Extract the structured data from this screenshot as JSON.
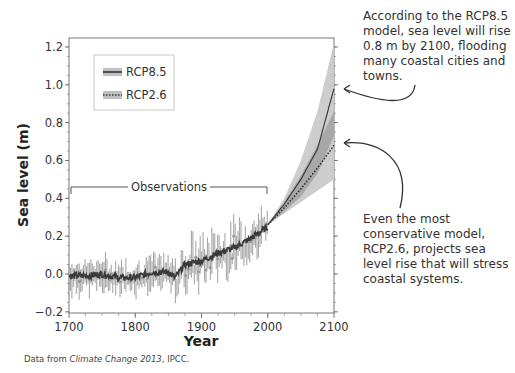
{
  "chart_data": {
    "type": "line",
    "title": "",
    "xlabel": "Year",
    "ylabel": "Sea level (m)",
    "xlim": [
      1700,
      2100
    ],
    "ylim": [
      -0.2,
      1.25
    ],
    "x_ticks": [
      "1700",
      "1800",
      "1900",
      "2000",
      "2100"
    ],
    "y_ticks": [
      "−0.2",
      "0.0",
      "0.2",
      "0.4",
      "0.6",
      "0.8",
      "1.0",
      "1.2"
    ],
    "grid": false,
    "legend_position": "upper-left",
    "legend": [
      {
        "name": "RCP8.5",
        "style": "solid dark line with gray band"
      },
      {
        "name": "RCP2.6",
        "style": "dotted dark line with gray band"
      }
    ],
    "annotations": [
      {
        "text": "Observations",
        "x_range": [
          1700,
          2000
        ]
      }
    ],
    "series": [
      {
        "name": "Observations",
        "x": [
          1700,
          1725,
          1750,
          1775,
          1800,
          1825,
          1850,
          1860,
          1875,
          1900,
          1925,
          1950,
          1975,
          2000
        ],
        "values": [
          -0.01,
          -0.01,
          0.0,
          -0.02,
          -0.02,
          0.01,
          0.01,
          -0.02,
          0.05,
          0.07,
          0.11,
          0.14,
          0.19,
          0.25
        ]
      },
      {
        "name": "RCP8.5",
        "x": [
          2000,
          2025,
          2050,
          2075,
          2100
        ],
        "values": [
          0.26,
          0.37,
          0.5,
          0.66,
          0.98
        ],
        "band_low": [
          0.26,
          0.33,
          0.41,
          0.53,
          0.73
        ],
        "band_high": [
          0.26,
          0.4,
          0.6,
          0.86,
          1.22
        ]
      },
      {
        "name": "RCP2.6",
        "x": [
          2000,
          2025,
          2050,
          2075,
          2100
        ],
        "values": [
          0.26,
          0.35,
          0.45,
          0.56,
          0.68
        ],
        "band_low": [
          0.26,
          0.32,
          0.38,
          0.44,
          0.5
        ],
        "band_high": [
          0.26,
          0.38,
          0.52,
          0.68,
          0.86
        ]
      }
    ]
  },
  "annotations": {
    "top_note": "According to the RCP8.5 model, sea level will rise 0.8 m by 2100, flooding many coastal cities and towns.",
    "bottom_note": "Even the most conservative model, RCP2.6, projects sea level rise that will stress coastal systems.",
    "observations_label": "Observations"
  },
  "source": {
    "prefix": "Data from ",
    "title": "Climate Change 2013",
    "suffix": ", IPCC."
  },
  "colors": {
    "observation_line": "#3a3a3a",
    "observation_errorbars": "#a8a8a8",
    "band_outer": "#c8c8c8",
    "band_inner": "#9a9a9a",
    "axis": "#444444",
    "text": "#333333"
  }
}
